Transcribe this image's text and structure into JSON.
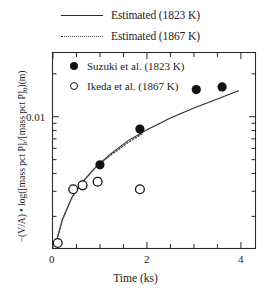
{
  "figure": {
    "outer_legend": [
      {
        "label": "Estimated (1823 K)",
        "style": "solid",
        "name": "legend-estimated-1823"
      },
      {
        "label": "Estimated (1867 K)",
        "style": "dotted",
        "name": "legend-estimated-1867"
      }
    ],
    "inner_legend": [
      {
        "label": "Suzuki et al. (1823 K)",
        "marker": "filled-circle"
      },
      {
        "label": "Ikeda et al. (1867 K)",
        "marker": "open-circle"
      }
    ],
    "ytick_label": "0.01",
    "xticks": [
      "0",
      "2",
      "4"
    ],
    "xlabel": "Time (ks)",
    "ylabel_parts": {
      "full": "−(V/A) • log([mass pct P]t/[mass pct P]0)(m)",
      "prefix": "−(V/A) • log([mass pct P]",
      "sub1": "t",
      "mid": "/[mass pct P]",
      "sub2": "0",
      "suffix": ")(m)"
    },
    "colors": {
      "axis": "#2b2b2b",
      "solid_line": "#2b2b2b",
      "dotted_line": "#4a4a4a",
      "marker_fill": "#111111",
      "background": "#ffffff"
    }
  },
  "chart_data": {
    "type": "scatter",
    "title": "",
    "xlabel": "Time (ks)",
    "ylabel": "−(V/A) • log([mass pct P]t/[mass pct P]0)(m)",
    "xlim": [
      0,
      4.3
    ],
    "ylim": [
      0.0012,
      0.028
    ],
    "yscale": "log",
    "xscale": "linear",
    "grid": false,
    "legend_position": "top-outside and inside-upper-left",
    "xticks_major": [
      0,
      2,
      4
    ],
    "xticks_minor": [
      0.5,
      1.0,
      1.5,
      2.5,
      3.0,
      3.5
    ],
    "yticks_major": [
      0.01
    ],
    "series": [
      {
        "name": "Suzuki et al. (1823 K)",
        "marker": "filled-circle",
        "type": "scatter",
        "x": [
          1.0,
          1.85,
          3.05,
          3.6
        ],
        "y": [
          0.0046,
          0.0082,
          0.0155,
          0.0162
        ]
      },
      {
        "name": "Ikeda et al. (1867 K)",
        "marker": "open-circle",
        "type": "scatter",
        "x": [
          0.1,
          0.43,
          0.63,
          0.95,
          1.85
        ],
        "y": [
          0.0013,
          0.0031,
          0.0033,
          0.0035,
          0.0031
        ]
      },
      {
        "name": "Estimated (1823 K)",
        "style": "solid",
        "type": "line",
        "x": [
          0.05,
          0.2,
          0.4,
          0.6,
          0.9,
          1.2,
          1.6,
          2.0,
          2.5,
          3.0,
          3.5,
          3.95
        ],
        "y": [
          0.00125,
          0.0019,
          0.0027,
          0.0034,
          0.0044,
          0.0054,
          0.0068,
          0.0081,
          0.0098,
          0.0115,
          0.0133,
          0.0152
        ]
      },
      {
        "name": "Estimated (1867 K)",
        "style": "dotted",
        "type": "line",
        "x": [
          0.05,
          0.2,
          0.4,
          0.6,
          0.9,
          1.2,
          1.6,
          1.9
        ],
        "y": [
          0.00125,
          0.0019,
          0.0027,
          0.0034,
          0.0044,
          0.0053,
          0.0066,
          0.0076
        ]
      }
    ]
  }
}
